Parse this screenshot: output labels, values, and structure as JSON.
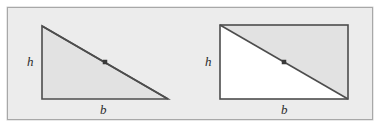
{
  "figure": {
    "canvas": {
      "width": 392,
      "height": 130,
      "background": "#ffffff"
    },
    "frame": {
      "x": 7,
      "y": 7,
      "width": 366,
      "height": 113,
      "fill": "#ececec",
      "border_color": "#a8a8a8"
    },
    "colors": {
      "shade_fill": "#e2e2e2",
      "white_fill": "#ffffff",
      "stroke": "#4d4d4d",
      "point": "#3a3a3a",
      "label_text": "#2b2b2b"
    },
    "panels": [
      {
        "id": "triangle-panel",
        "name": "right-triangle",
        "shape": "triangle",
        "vertices": [
          [
            42,
            26
          ],
          [
            42,
            99
          ],
          [
            168,
            99
          ]
        ],
        "shaded_region": "whole-triangle",
        "midpoint_marker": {
          "x": 105,
          "y": 62,
          "size": 4,
          "shape": "square"
        },
        "labels": {
          "height": {
            "text": "h",
            "x": 27,
            "y": 55
          },
          "base": {
            "text": "b",
            "x": 100,
            "y": 103
          }
        }
      },
      {
        "id": "rectangle-panel",
        "name": "rectangle-with-diagonal",
        "shape": "rectangle",
        "corners": {
          "x1": 220,
          "y1": 25,
          "x2": 348,
          "y2": 99
        },
        "diagonal": [
          [
            220,
            25
          ],
          [
            348,
            99
          ]
        ],
        "shaded_region": "upper-right-triangle",
        "unshaded_region": "lower-left-triangle",
        "midpoint_marker": {
          "x": 284,
          "y": 62,
          "size": 4,
          "shape": "square"
        },
        "labels": {
          "height": {
            "text": "h",
            "x": 205,
            "y": 55
          },
          "base": {
            "text": "b",
            "x": 281,
            "y": 103
          }
        }
      }
    ]
  }
}
